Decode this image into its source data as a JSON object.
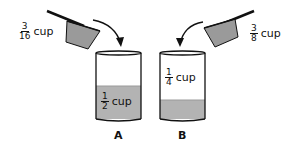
{
  "colors": {
    "liquid": "#b3b3b3",
    "scoop": "#9a9a9a",
    "outline": "#111111"
  },
  "scoops": [
    {
      "numerator": "3",
      "denominator": "16",
      "unit": "cup",
      "target": "A"
    },
    {
      "numerator": "3",
      "denominator": "8",
      "unit": "cup",
      "target": "B"
    }
  ],
  "containers": [
    {
      "label": "A",
      "numerator": "1",
      "denominator": "2",
      "unit": "cup"
    },
    {
      "label": "B",
      "numerator": "1",
      "denominator": "4",
      "unit": "cup"
    }
  ]
}
